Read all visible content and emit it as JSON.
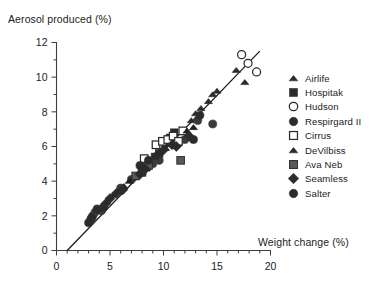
{
  "chart_data": {
    "type": "scatter",
    "title": "",
    "xlabel": "Weight change (%)",
    "ylabel": "Aerosol produced (%)",
    "xlim": [
      0,
      20
    ],
    "ylim": [
      0,
      12
    ],
    "xticks": [
      0,
      5,
      10,
      15,
      20
    ],
    "yticks": [
      0,
      2,
      4,
      6,
      8,
      10,
      12
    ],
    "xtick_labels": [
      "0",
      "5",
      "10",
      "15",
      "20"
    ],
    "ytick_labels": [
      "0",
      "2",
      "4",
      "6",
      "8",
      "10",
      "12"
    ],
    "x_minor_interval": 1,
    "y_minor_interval": 1,
    "grid": false,
    "legend_position": "right",
    "regression_line": {
      "label": "fit-line",
      "x_start": 1.0,
      "y_start": 0.0,
      "x_end": 19.0,
      "y_end": 11.5
    },
    "series": [
      {
        "name": "Airlife",
        "marker": "triangle-filled",
        "color": "#2b2b2b",
        "points": [
          [
            12.6,
            7.5
          ],
          [
            13.0,
            7.9
          ],
          [
            13.5,
            8.2
          ],
          [
            14.2,
            8.6
          ],
          [
            14.6,
            9.0
          ],
          [
            15.0,
            9.2
          ],
          [
            16.8,
            10.4
          ],
          [
            17.6,
            9.7
          ]
        ]
      },
      {
        "name": "Hospitak",
        "marker": "square-filled",
        "color": "#2b2b2b",
        "points": [
          [
            8.0,
            4.5
          ],
          [
            8.4,
            4.8
          ],
          [
            8.8,
            5.1
          ],
          [
            9.2,
            5.4
          ],
          [
            9.6,
            5.6
          ],
          [
            10.2,
            6.2
          ],
          [
            10.6,
            6.5
          ],
          [
            11.0,
            6.8
          ]
        ]
      },
      {
        "name": "Hudson",
        "marker": "circle-open",
        "color": "#2b2b2b",
        "points": [
          [
            17.3,
            11.3
          ],
          [
            17.9,
            10.8
          ],
          [
            18.7,
            10.3
          ]
        ]
      },
      {
        "name": "Respirgard  II",
        "marker": "circle-filled",
        "color": "#3a3a3a",
        "points": [
          [
            3.2,
            1.8
          ],
          [
            3.4,
            2.0
          ],
          [
            3.6,
            2.2
          ],
          [
            4.2,
            2.3
          ],
          [
            6.0,
            3.6
          ],
          [
            7.0,
            4.1
          ],
          [
            9.0,
            5.0
          ],
          [
            9.6,
            5.2
          ],
          [
            11.4,
            6.2
          ],
          [
            12.0,
            6.4
          ],
          [
            13.2,
            7.5
          ],
          [
            14.6,
            7.3
          ]
        ]
      },
      {
        "name": "Cirrus",
        "marker": "square-open",
        "color": "#2b2b2b",
        "points": [
          [
            8.2,
            5.3
          ],
          [
            9.3,
            6.1
          ],
          [
            9.9,
            6.3
          ],
          [
            10.4,
            6.4
          ],
          [
            10.9,
            6.6
          ],
          [
            11.4,
            6.3
          ],
          [
            11.8,
            6.9
          ]
        ]
      },
      {
        "name": "DeVilbiss",
        "marker": "triangle-filled",
        "color": "#1f1f1f",
        "points": [
          [
            5.3,
            3.2
          ],
          [
            5.8,
            3.4
          ],
          [
            6.3,
            3.7
          ],
          [
            6.8,
            4.0
          ],
          [
            7.2,
            4.2
          ],
          [
            7.6,
            4.4
          ],
          [
            10.2,
            5.9
          ],
          [
            12.2,
            6.9
          ],
          [
            12.8,
            7.1
          ]
        ]
      },
      {
        "name": "Ava  Neb",
        "marker": "square-hatched",
        "color": "#4a4a4a",
        "points": [
          [
            7.4,
            4.3
          ],
          [
            8.0,
            4.6
          ],
          [
            8.6,
            4.9
          ],
          [
            11.6,
            5.2
          ]
        ]
      },
      {
        "name": "Seamless",
        "marker": "diamond-filled",
        "color": "#2b2b2b",
        "points": [
          [
            4.6,
            2.7
          ],
          [
            5.0,
            3.0
          ],
          [
            5.6,
            3.3
          ],
          [
            6.2,
            3.5
          ],
          [
            7.8,
            4.4
          ],
          [
            8.3,
            4.7
          ],
          [
            9.4,
            5.5
          ],
          [
            10.0,
            5.8
          ],
          [
            10.8,
            6.1
          ],
          [
            11.2,
            6.0
          ],
          [
            12.4,
            6.6
          ]
        ]
      },
      {
        "name": "Salter",
        "marker": "circle-filled",
        "color": "#2b2b2b",
        "points": [
          [
            3.0,
            1.6
          ],
          [
            3.3,
            1.9
          ],
          [
            3.8,
            2.4
          ],
          [
            4.4,
            2.5
          ],
          [
            7.8,
            4.9
          ],
          [
            8.6,
            5.2
          ],
          [
            12.8,
            6.4
          ],
          [
            13.4,
            7.8
          ]
        ]
      }
    ]
  },
  "legend": {
    "items": [
      {
        "label": "Airlife",
        "marker": "triangle-filled"
      },
      {
        "label": "Hospitak",
        "marker": "square-filled"
      },
      {
        "label": "Hudson",
        "marker": "circle-open"
      },
      {
        "label": "Respirgard  II",
        "marker": "circle-filled"
      },
      {
        "label": "Cirrus",
        "marker": "square-open"
      },
      {
        "label": "DeVilbiss",
        "marker": "triangle-filled"
      },
      {
        "label": "Ava  Neb",
        "marker": "square-hatched"
      },
      {
        "label": "Seamless",
        "marker": "diamond-filled"
      },
      {
        "label": "Salter",
        "marker": "circle-filled"
      }
    ]
  },
  "colors": {
    "ink": "#1c1c1c",
    "axis": "#3c3c3c",
    "marker": "#2b2b2b",
    "background": "#ffffff"
  }
}
